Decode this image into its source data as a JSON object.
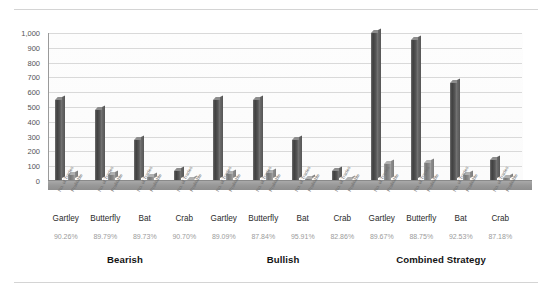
{
  "chart_data": {
    "type": "bar",
    "title": "",
    "subtitle": "",
    "xlabel": "",
    "ylabel": "",
    "ylim": [
      0,
      1000
    ],
    "yticks": [
      0,
      100,
      200,
      300,
      400,
      500,
      600,
      700,
      800,
      900,
      1000
    ],
    "ytick_labels": [
      "0",
      "100",
      "200",
      "300",
      "400",
      "500",
      "600",
      "700",
      "800",
      "900",
      "1,000"
    ],
    "grid": true,
    "legend": "none",
    "three_d": true,
    "categories": [
      "Gartley",
      "Butterfly",
      "Bat",
      "Crab",
      "Gartley",
      "Butterfly",
      "Bat",
      "Crab",
      "Gartley",
      "Butterfly",
      "Bat",
      "Crab"
    ],
    "groups": [
      {
        "label": "Bearish",
        "categories": [
          "Gartley",
          "Butterfly",
          "Bat",
          "Crab"
        ]
      },
      {
        "label": "Bullish",
        "categories": [
          "Gartley",
          "Butterfly",
          "Bat",
          "Crab"
        ]
      },
      {
        "label": "Combined Strategy",
        "categories": [
          "Gartley",
          "Butterfly",
          "Bat",
          "Crab"
        ]
      }
    ],
    "series": [
      {
        "name": "Total",
        "values": [
          550,
          480,
          280,
          70,
          545,
          550,
          280,
          65,
          1000,
          950,
          660,
          140
        ]
      },
      {
        "name": "Secondary",
        "values": [
          42,
          42,
          30,
          6,
          48,
          52,
          14,
          8,
          118,
          125,
          42,
          18
        ]
      }
    ],
    "percent_labels": [
      "90.26%",
      "89.79%",
      "89.73%",
      "90.70%",
      "89.09%",
      "87.84%",
      "95.91%",
      "82.86%",
      "89.67%",
      "88.75%",
      "92.53%",
      "87.18%"
    ],
    "tick_micro_labels": [
      "No. of Trades",
      "Profitable",
      "No. of Trades",
      "Profitable",
      "No. of Trades",
      "Profitable",
      "No. of Trades",
      "Profitable",
      "No. of Trades",
      "Profitable",
      "No. of Trades",
      "Profitable",
      "No. of Trades",
      "Profitable",
      "No. of Trades",
      "Profitable",
      "No. of Trades",
      "Profitable",
      "No. of Trades",
      "Profitable",
      "No. of Trades",
      "Profitable",
      "No. of Trades",
      "Profitable"
    ],
    "colors": {
      "series_primary": "#4a4a4a",
      "series_secondary": "#8a8a8a",
      "grid": "#d9d9d9",
      "axis": "#9a9a9a",
      "percent_text": "#9b9b9b",
      "category_text": "#2b2b2b",
      "group_text": "#141414",
      "floor": "#999999",
      "background": "#ffffff"
    }
  }
}
